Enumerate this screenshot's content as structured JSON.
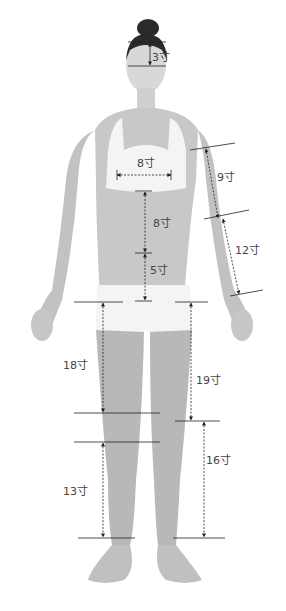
{
  "diagram": {
    "unit": "寸",
    "line_color": "#222222",
    "label_color": "#444444",
    "skin_color": "#bdbdbd",
    "cloth_color": "#f4f4f4",
    "measurements": [
      {
        "id": "forehead",
        "label": "3寸",
        "x": 152,
        "y": 52
      },
      {
        "id": "chest-width",
        "label": "8寸",
        "x": 137,
        "y": 158
      },
      {
        "id": "upper-abdomen",
        "label": "8寸",
        "x": 153,
        "y": 218
      },
      {
        "id": "lower-abdomen",
        "label": "5寸",
        "x": 150,
        "y": 265
      },
      {
        "id": "upper-arm",
        "label": "9寸",
        "x": 217,
        "y": 172
      },
      {
        "id": "forearm",
        "label": "12寸",
        "x": 235,
        "y": 245
      },
      {
        "id": "thigh-inner",
        "label": "18寸",
        "x": 63,
        "y": 360
      },
      {
        "id": "thigh-outer",
        "label": "19寸",
        "x": 196,
        "y": 375
      },
      {
        "id": "lower-leg-inner",
        "label": "13寸",
        "x": 63,
        "y": 486
      },
      {
        "id": "lower-leg-outer",
        "label": "16寸",
        "x": 206,
        "y": 455
      }
    ]
  }
}
